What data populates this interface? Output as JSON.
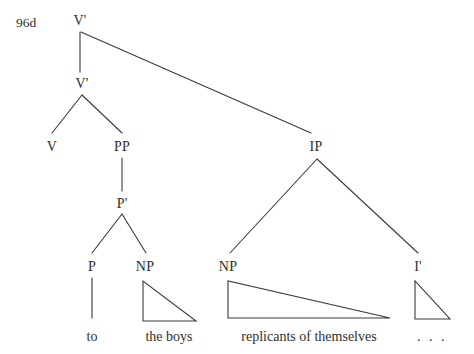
{
  "figure": {
    "example_number": "96d",
    "background_color": "#ffffff",
    "line_color": "#3a3a3a",
    "text_color": "#2e2e2e"
  },
  "tree": {
    "nodes": [
      {
        "id": "vbar-top",
        "label": "V'",
        "x": 80,
        "y": 14
      },
      {
        "id": "vbar-lower",
        "label": "V'",
        "x": 82,
        "y": 77
      },
      {
        "id": "v",
        "label": "V",
        "x": 52,
        "y": 140
      },
      {
        "id": "pp",
        "label": "PP",
        "x": 122,
        "y": 140
      },
      {
        "id": "pbar",
        "label": "P'",
        "x": 122,
        "y": 197
      },
      {
        "id": "p",
        "label": "P",
        "x": 92,
        "y": 260
      },
      {
        "id": "np-left",
        "label": "NP",
        "x": 145,
        "y": 260
      },
      {
        "id": "ip",
        "label": "IP",
        "x": 316,
        "y": 140
      },
      {
        "id": "np-right",
        "label": "NP",
        "x": 228,
        "y": 260
      },
      {
        "id": "ibar",
        "label": "I'",
        "x": 418,
        "y": 260
      }
    ],
    "terminals": [
      {
        "id": "to",
        "label": "to",
        "x": 92,
        "y": 330
      },
      {
        "id": "the-boys",
        "label": "the boys",
        "x": 169,
        "y": 330
      },
      {
        "id": "replicants",
        "label": "replicants of themselves",
        "x": 309,
        "y": 330
      },
      {
        "id": "ellipsis",
        "label": ". . .",
        "x": 432,
        "y": 330
      }
    ],
    "edges": [
      {
        "id": "vbartop-to-vbarlower",
        "from": "vbar-top",
        "to": "vbar-lower",
        "x1": 80,
        "y1": 32,
        "x2": 80,
        "y2": 72
      },
      {
        "id": "vbartop-to-ip",
        "from": "vbar-top",
        "to": "ip",
        "x1": 81,
        "y1": 32,
        "x2": 311,
        "y2": 133
      },
      {
        "id": "vbarlower-to-v",
        "from": "vbar-lower",
        "to": "v",
        "x1": 82,
        "y1": 95,
        "x2": 52,
        "y2": 133
      },
      {
        "id": "vbarlower-to-pp",
        "from": "vbar-lower",
        "to": "pp",
        "x1": 82,
        "y1": 95,
        "x2": 122,
        "y2": 133
      },
      {
        "id": "pp-to-pbar",
        "from": "pp",
        "to": "pbar",
        "x1": 122,
        "y1": 158,
        "x2": 122,
        "y2": 191
      },
      {
        "id": "pbar-to-p",
        "from": "pbar",
        "to": "p",
        "x1": 122,
        "y1": 214,
        "x2": 92,
        "y2": 253
      },
      {
        "id": "pbar-to-np",
        "from": "pbar",
        "to": "np-left",
        "x1": 122,
        "y1": 214,
        "x2": 146,
        "y2": 253
      },
      {
        "id": "ip-to-np",
        "from": "ip",
        "to": "np-right",
        "x1": 317,
        "y1": 159,
        "x2": 230,
        "y2": 253
      },
      {
        "id": "ip-to-ibar",
        "from": "ip",
        "to": "ibar",
        "x1": 317,
        "y1": 159,
        "x2": 418,
        "y2": 253
      },
      {
        "id": "p-to-to",
        "from": "p",
        "to": "to",
        "x1": 92,
        "y1": 278,
        "x2": 92,
        "y2": 318
      }
    ],
    "triangles": [
      {
        "id": "np-left-triangle",
        "under": "np-left",
        "apex_x": 143,
        "apex_y": 281,
        "left_x": 143,
        "base_y": 321,
        "right_x": 196
      },
      {
        "id": "np-right-triangle",
        "under": "np-right",
        "apex_x": 228,
        "apex_y": 281,
        "left_x": 228,
        "base_y": 318,
        "right_x": 390
      },
      {
        "id": "ibar-triangle",
        "under": "ibar",
        "apex_x": 415,
        "apex_y": 281,
        "left_x": 415,
        "base_y": 319,
        "right_x": 450
      }
    ]
  }
}
